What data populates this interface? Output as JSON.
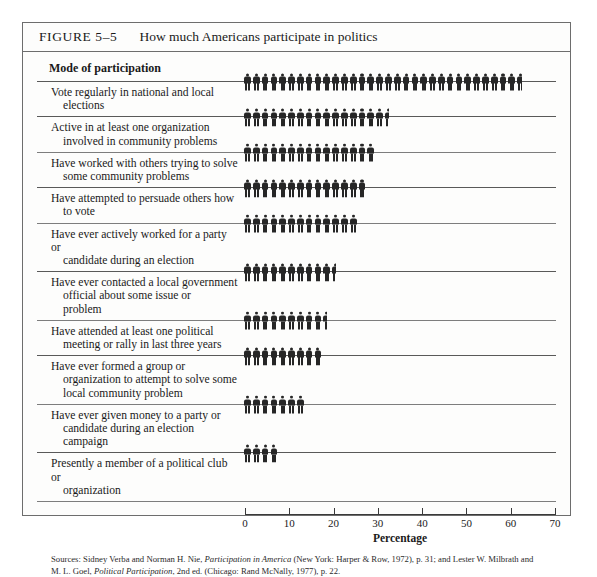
{
  "figure": {
    "number": "FIGURE 5–5",
    "title": "How much Americans participate in politics",
    "column_header": "Mode of participation"
  },
  "sources": {
    "prefix": "Sources: Sidney Verba and Norman H. Nie, ",
    "italic1": "Participation in America",
    "middle": " (New York: Harper & Row, 1972), p. 31; and Lester W. Milbrath and M. L. Goel, ",
    "italic2": "Political Participation",
    "suffix": ", 2nd ed. (Chicago: Rand McNally, 1977), p. 22."
  },
  "chart_data": {
    "type": "bar",
    "title": "How much Americans participate in politics",
    "xlabel": "Percentage",
    "ylabel": "Mode of participation",
    "xlim": [
      0,
      70
    ],
    "xticks": [
      0,
      10,
      20,
      30,
      40,
      50,
      60,
      70
    ],
    "grid": false,
    "legend": null,
    "units": "percent",
    "pictogram": {
      "glyph": "person-icon",
      "value_per_figure": 2,
      "color": "#262626"
    },
    "categories": [
      "Vote regularly in national and local elections",
      "Active in at least one organization involved in community problems",
      "Have worked with others trying to solve some community problems",
      "Have attempted to persuade others how to vote",
      "Have ever actively worked for a party or candidate during an election",
      "Have ever contacted a local government official about some issue or problem",
      "Have attended at least one political meeting or rally in last three years",
      "Have ever formed a group or organization to attempt to solve some local community problem",
      "Have ever given money to a party or candidate during an election campaign",
      "Presently a member of a political club or organization"
    ],
    "values": [
      63,
      33,
      30,
      28,
      26,
      21,
      19,
      18,
      14,
      8
    ],
    "rows": [
      {
        "label_line1": "Vote regularly in national and local",
        "label_line2": "elections",
        "value": 63
      },
      {
        "label_line1": "Active in at least one organization",
        "label_line2": "involved in community problems",
        "value": 33
      },
      {
        "label_line1": "Have worked with others trying to solve",
        "label_line2": "some community problems",
        "value": 30
      },
      {
        "label_line1": "Have attempted to persuade others how",
        "label_line2": "to vote",
        "value": 28
      },
      {
        "label_line1": "Have ever actively worked for a party or",
        "label_line2": "candidate during an election",
        "value": 26
      },
      {
        "label_line1": "Have ever contacted a local government",
        "label_line2": "official about some issue or",
        "label_line3": "problem",
        "value": 21
      },
      {
        "label_line1": "Have attended at least one political",
        "label_line2": "meeting or rally in last three years",
        "value": 19
      },
      {
        "label_line1": "Have ever formed a group or",
        "label_line2": "organization to attempt to solve some",
        "label_line3": "local community problem",
        "value": 18
      },
      {
        "label_line1": "Have ever given money to a party or",
        "label_line2": "candidate during an election",
        "label_line3": "campaign",
        "value": 14
      },
      {
        "label_line1": "Presently a member of a political club or",
        "label_line2": "organization",
        "value": 8
      }
    ]
  }
}
